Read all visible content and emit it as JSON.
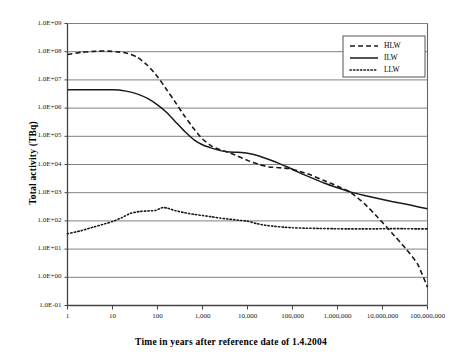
{
  "chart_data": {
    "type": "line",
    "title": "",
    "xlabel": "Time in years after reference date of 1.4.2004",
    "ylabel": "Total activity (TBq)",
    "xscale": "log",
    "yscale": "log",
    "xlim": [
      1,
      100000000
    ],
    "ylim": [
      0.1,
      1000000000
    ],
    "grid": true,
    "grid_axis": "y",
    "legend_position": "top-right",
    "xticks": [
      1,
      10,
      100,
      1000,
      10000,
      100000,
      1000000,
      10000000,
      100000000
    ],
    "xticklabels": [
      "1",
      "10",
      "100",
      "1,000",
      "10,000",
      "100,000",
      "1,000,000",
      "10,000,000",
      "100,000,000"
    ],
    "yticks": [
      0.1,
      1,
      10,
      100,
      1000,
      10000,
      100000,
      1000000,
      10000000,
      100000000,
      1000000000
    ],
    "yticklabels": [
      "1.0E-01",
      "1.0E+00",
      "1.0E+01",
      "1.0E+02",
      "1.0E+03",
      "1.0E+04",
      "1.0E+05",
      "1.0E+06",
      "1.0E+07",
      "1.0E+08",
      "1.0E+09"
    ],
    "series": [
      {
        "name": "HLW",
        "style": "dashed",
        "color": "#1a1a1a",
        "points": [
          [
            1,
            80000000
          ],
          [
            2,
            95000000
          ],
          [
            3,
            100000000
          ],
          [
            5,
            105000000
          ],
          [
            8,
            105000000
          ],
          [
            12,
            100000000
          ],
          [
            20,
            90000000
          ],
          [
            35,
            65000000
          ],
          [
            60,
            33000000
          ],
          [
            100,
            13000000
          ],
          [
            160,
            4500000
          ],
          [
            250,
            1600000
          ],
          [
            400,
            520000
          ],
          [
            650,
            180000
          ],
          [
            1000,
            80000
          ],
          [
            1600,
            45000
          ],
          [
            2500,
            33000
          ],
          [
            4000,
            26000
          ],
          [
            6000,
            20000
          ],
          [
            10000,
            14000
          ],
          [
            18000,
            10000
          ],
          [
            30000,
            8200
          ],
          [
            50000,
            7700
          ],
          [
            80000,
            7200
          ],
          [
            130000,
            6000
          ],
          [
            250000,
            4300
          ],
          [
            500000,
            2700
          ],
          [
            1000000,
            1700
          ],
          [
            2000000,
            1000
          ],
          [
            4000000,
            400
          ],
          [
            8000000,
            130
          ],
          [
            16000000,
            38
          ],
          [
            32000000,
            11
          ],
          [
            60000000,
            3
          ],
          [
            100000000,
            0.45
          ]
        ]
      },
      {
        "name": "ILW",
        "style": "solid",
        "color": "#1a1a1a",
        "points": [
          [
            1,
            4500000
          ],
          [
            3,
            4500000
          ],
          [
            6,
            4500000
          ],
          [
            10,
            4500000
          ],
          [
            14,
            4400000
          ],
          [
            20,
            4000000
          ],
          [
            35,
            3200000
          ],
          [
            60,
            2200000
          ],
          [
            100,
            1300000
          ],
          [
            160,
            700000
          ],
          [
            250,
            330000
          ],
          [
            400,
            150000
          ],
          [
            650,
            75000
          ],
          [
            1000,
            50000
          ],
          [
            1600,
            38000
          ],
          [
            2500,
            31000
          ],
          [
            4000,
            28000
          ],
          [
            6000,
            27000
          ],
          [
            10000,
            25000
          ],
          [
            18000,
            20000
          ],
          [
            30000,
            15000
          ],
          [
            50000,
            11000
          ],
          [
            80000,
            8000
          ],
          [
            130000,
            5500
          ],
          [
            250000,
            3500
          ],
          [
            500000,
            2200
          ],
          [
            1000000,
            1500
          ],
          [
            2000000,
            1050
          ],
          [
            4000000,
            800
          ],
          [
            8000000,
            620
          ],
          [
            16000000,
            490
          ],
          [
            32000000,
            400
          ],
          [
            60000000,
            320
          ],
          [
            100000000,
            270
          ]
        ]
      },
      {
        "name": "LLW",
        "style": "dotted",
        "color": "#1a1a1a",
        "points": [
          [
            1,
            35
          ],
          [
            2,
            45
          ],
          [
            4,
            62
          ],
          [
            7,
            80
          ],
          [
            10,
            95
          ],
          [
            16,
            130
          ],
          [
            25,
            185
          ],
          [
            40,
            215
          ],
          [
            60,
            225
          ],
          [
            90,
            235
          ],
          [
            130,
            300
          ],
          [
            170,
            280
          ],
          [
            250,
            230
          ],
          [
            400,
            195
          ],
          [
            650,
            170
          ],
          [
            1000,
            155
          ],
          [
            1600,
            140
          ],
          [
            2500,
            125
          ],
          [
            4000,
            115
          ],
          [
            6500,
            105
          ],
          [
            10000,
            98
          ],
          [
            16000,
            80
          ],
          [
            25000,
            70
          ],
          [
            40000,
            64
          ],
          [
            65000,
            60
          ],
          [
            100000,
            57
          ],
          [
            200000,
            55
          ],
          [
            400000,
            54
          ],
          [
            800000,
            53
          ],
          [
            1600000,
            52
          ],
          [
            3200000,
            52
          ],
          [
            6500000,
            52
          ],
          [
            13000000,
            53
          ],
          [
            30000000,
            53
          ],
          [
            60000000,
            52
          ],
          [
            100000000,
            52
          ]
        ]
      }
    ]
  },
  "legend": {
    "items": [
      {
        "label": "HLW",
        "style": "dashed"
      },
      {
        "label": "ILW",
        "style": "solid"
      },
      {
        "label": "LLW",
        "style": "dotted"
      }
    ]
  },
  "axes": {
    "x_title": "Time in years after reference date of 1.4.2004",
    "y_title": "Total activity (TBq)"
  },
  "colors": {
    "line": "#1a1a1a",
    "grid": "#808080",
    "axis": "#555555",
    "background": "#ffffff"
  }
}
